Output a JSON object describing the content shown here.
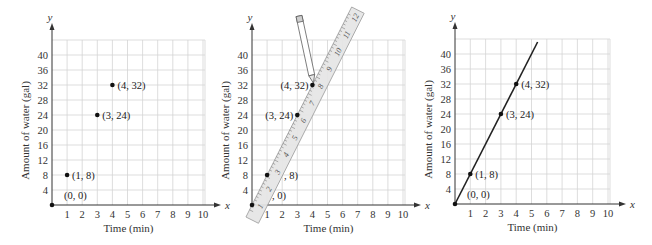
{
  "chart_data": [
    {
      "type": "scatter",
      "title": "",
      "xlabel": "Time (min)",
      "ylabel": "Amount of water (gal)",
      "x_axis_var": "x",
      "y_axis_var": "y",
      "xlim": [
        0,
        10
      ],
      "ylim": [
        0,
        44
      ],
      "x_ticks": [
        1,
        2,
        3,
        4,
        5,
        6,
        7,
        8,
        9,
        10
      ],
      "y_ticks": [
        4,
        8,
        12,
        16,
        20,
        24,
        28,
        32,
        36,
        40
      ],
      "grid": true,
      "points": [
        {
          "x": 0,
          "y": 0,
          "label": "(0, 0)"
        },
        {
          "x": 1,
          "y": 8,
          "label": "(1, 8)"
        },
        {
          "x": 3,
          "y": 24,
          "label": "(3, 24)"
        },
        {
          "x": 4,
          "y": 32,
          "label": "(4, 32)"
        }
      ],
      "line": null,
      "ruler": null
    },
    {
      "type": "scatter",
      "title": "",
      "xlabel": "Time (min)",
      "ylabel": "Amount of water (gal)",
      "x_axis_var": "x",
      "y_axis_var": "y",
      "xlim": [
        0,
        10
      ],
      "ylim": [
        0,
        44
      ],
      "x_ticks": [
        1,
        2,
        3,
        4,
        5,
        6,
        7,
        8,
        9,
        10
      ],
      "y_ticks": [
        4,
        8,
        12,
        16,
        20,
        24,
        28,
        32,
        36,
        40
      ],
      "grid": true,
      "points": [
        {
          "x": 0,
          "y": 0,
          "label": ", 0)"
        },
        {
          "x": 1,
          "y": 8,
          "label": ", 8)"
        },
        {
          "x": 3,
          "y": 24,
          "label": "(3, 24)"
        },
        {
          "x": 4,
          "y": 32,
          "label": "(4, 32)"
        }
      ],
      "line": null,
      "ruler": {
        "markings": [
          "1",
          "2",
          "3",
          "4",
          "5",
          "6",
          "7",
          "8",
          "9",
          "10",
          "11",
          "12"
        ],
        "has_pencil": true
      }
    },
    {
      "type": "line",
      "title": "",
      "xlabel": "Time (min)",
      "ylabel": "Amount of water (gal)",
      "x_axis_var": "x",
      "y_axis_var": "y",
      "xlim": [
        0,
        10
      ],
      "ylim": [
        0,
        44
      ],
      "x_ticks": [
        1,
        2,
        3,
        4,
        5,
        6,
        7,
        8,
        9,
        10
      ],
      "y_ticks": [
        4,
        8,
        12,
        16,
        20,
        24,
        28,
        32,
        36,
        40
      ],
      "grid": true,
      "points": [
        {
          "x": 0,
          "y": 0,
          "label": "(0, 0)"
        },
        {
          "x": 1,
          "y": 8,
          "label": "(1, 8)"
        },
        {
          "x": 3,
          "y": 24,
          "label": "(3, 24)"
        },
        {
          "x": 4,
          "y": 32,
          "label": "(4, 32)"
        }
      ],
      "line": {
        "slope": 8,
        "intercept": 0,
        "x_end": 5.4
      },
      "ruler": null
    }
  ],
  "panels": [
    {
      "ox": 52,
      "oy": 205,
      "ux": 15.1,
      "uy": 3.75,
      "left": 0
    },
    {
      "ox": 252,
      "oy": 205,
      "ux": 15.1,
      "uy": 3.75,
      "left": 0
    },
    {
      "ox": 455,
      "oy": 204,
      "ux": 15.3,
      "uy": 3.75,
      "left": 0
    }
  ]
}
